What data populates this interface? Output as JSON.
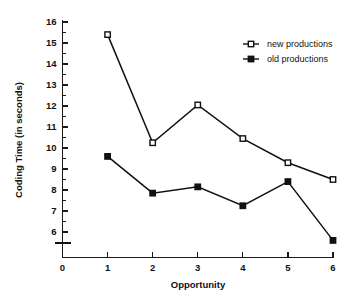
{
  "chart_data": {
    "type": "line",
    "title": "",
    "xlabel": "Opportunity",
    "ylabel": "Coding Time (in seconds)",
    "x": [
      1,
      2,
      3,
      4,
      5,
      6
    ],
    "xlim": [
      0,
      6
    ],
    "ylim": [
      6,
      16
    ],
    "y_axis_break": true,
    "grid": false,
    "legend_position": "top-right",
    "x_tick_labels": [
      "0",
      "1",
      "2",
      "3",
      "4",
      "5",
      "6"
    ],
    "y_tick_labels": [
      "6",
      "7",
      "8",
      "9",
      "10",
      "11",
      "12",
      "13",
      "14",
      "15",
      "16"
    ],
    "y_minor_ticks": true,
    "series": [
      {
        "name": "new productions",
        "marker": "open-square",
        "values": [
          15.4,
          10.25,
          12.05,
          10.45,
          9.3,
          8.5
        ]
      },
      {
        "name": "old productions",
        "marker": "filled-square",
        "values": [
          9.6,
          7.85,
          8.15,
          7.25,
          8.4,
          5.6
        ]
      }
    ]
  },
  "colors": {
    "ink": "#111111",
    "background": "#ffffff"
  }
}
